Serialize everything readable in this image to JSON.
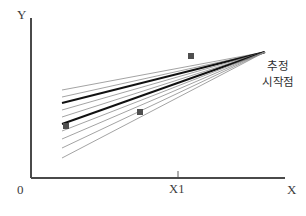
{
  "figure": {
    "background_color": "#ffffff",
    "width": 306,
    "height": 216
  },
  "axes": {
    "y_label": "Y",
    "x_label": "X",
    "origin_label": "0",
    "tick_label": "X1",
    "axis_color": "#4a4a4a",
    "x_axis": {
      "x1": 31,
      "y1": 178,
      "x2": 285,
      "y2": 178
    },
    "y_axis": {
      "x1": 31,
      "y1": 18,
      "x2": 31,
      "y2": 178
    },
    "ticks": [
      {
        "label": "X1",
        "x": 178,
        "y": 178,
        "length": 7
      }
    ]
  },
  "annotation": {
    "lines": [
      "추정",
      "시작점"
    ],
    "line1": "추정",
    "line2": "시작점",
    "color": "#2e2e2e",
    "x": 251,
    "y": 58
  },
  "chart_data": {
    "type": "line",
    "title": "추정 시작점",
    "xlabel": "X",
    "ylabel": "Y",
    "grid": false,
    "legend": "none",
    "xlim": [
      31,
      285
    ],
    "ylim": [
      178,
      18
    ],
    "convergence_point": {
      "x": 265,
      "y": 52
    },
    "fan_origin_x": 62,
    "lines": [
      {
        "name": "line-1",
        "x1": 62,
        "y1": 90,
        "x2": 265,
        "y2": 52,
        "weight": "thin",
        "color": "#8c8c8c",
        "width": 0.8
      },
      {
        "name": "line-2",
        "x1": 62,
        "y1": 97,
        "x2": 265,
        "y2": 52,
        "weight": "thin",
        "color": "#8c8c8c",
        "width": 0.8
      },
      {
        "name": "line-3",
        "x1": 62,
        "y1": 103,
        "x2": 265,
        "y2": 52,
        "weight": "bold",
        "color": "#111111",
        "width": 1.9
      },
      {
        "name": "line-4",
        "x1": 62,
        "y1": 110,
        "x2": 265,
        "y2": 52,
        "weight": "thin",
        "color": "#8c8c8c",
        "width": 0.8
      },
      {
        "name": "line-5",
        "x1": 62,
        "y1": 117,
        "x2": 265,
        "y2": 52,
        "weight": "thin",
        "color": "#8c8c8c",
        "width": 0.8
      },
      {
        "name": "line-6",
        "x1": 62,
        "y1": 124,
        "x2": 265,
        "y2": 52,
        "weight": "bold",
        "color": "#111111",
        "width": 1.9
      },
      {
        "name": "line-7",
        "x1": 62,
        "y1": 131,
        "x2": 265,
        "y2": 52,
        "weight": "thin",
        "color": "#8c8c8c",
        "width": 0.8
      },
      {
        "name": "line-8",
        "x1": 62,
        "y1": 139,
        "x2": 265,
        "y2": 52,
        "weight": "thin",
        "color": "#8c8c8c",
        "width": 0.8
      },
      {
        "name": "line-9",
        "x1": 62,
        "y1": 148,
        "x2": 265,
        "y2": 52,
        "weight": "thin",
        "color": "#8c8c8c",
        "width": 0.8
      },
      {
        "name": "line-10",
        "x1": 62,
        "y1": 158,
        "x2": 265,
        "y2": 52,
        "weight": "thin",
        "color": "#8c8c8c",
        "width": 0.8
      }
    ],
    "points": [
      {
        "name": "point-upper",
        "x": 191,
        "y": 56,
        "size": 6,
        "color": "#4f4f4f"
      },
      {
        "name": "point-middle",
        "x": 140,
        "y": 112,
        "size": 6,
        "color": "#4f4f4f"
      },
      {
        "name": "point-lower",
        "x": 66,
        "y": 126,
        "size": 6,
        "color": "#4f4f4f"
      }
    ]
  }
}
